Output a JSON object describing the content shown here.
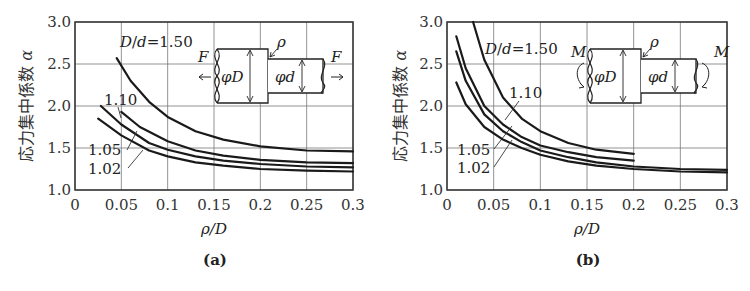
{
  "chart_data": [
    {
      "type": "line",
      "panel": "(a)",
      "title": "",
      "xlabel": "ρ/D",
      "ylabel": "応力集中係数 α",
      "xlim": [
        0,
        0.3
      ],
      "ylim": [
        1.0,
        3.0
      ],
      "xticks": [
        "0",
        "0.05",
        "0.1",
        "0.15",
        "0.2",
        "0.25",
        "0.3"
      ],
      "yticks": [
        "1.0",
        "1.5",
        "2.0",
        "2.5",
        "3.0"
      ],
      "grid": true,
      "load_symbol": "F",
      "inset_labels": {
        "big": "φD",
        "small": "φd",
        "radius": "ρ",
        "load_left": "F",
        "load_right": "F"
      },
      "series": [
        {
          "name": "D/d=1.50",
          "label": "D/d=1.50",
          "x": [
            0.045,
            0.06,
            0.08,
            0.1,
            0.13,
            0.16,
            0.2,
            0.25,
            0.3
          ],
          "y": [
            2.57,
            2.3,
            2.05,
            1.87,
            1.7,
            1.6,
            1.52,
            1.47,
            1.46
          ]
        },
        {
          "name": "1.10",
          "label": "1.10",
          "x": [
            0.05,
            0.07,
            0.1,
            0.13,
            0.16,
            0.2,
            0.25,
            0.3
          ],
          "y": [
            1.93,
            1.75,
            1.58,
            1.47,
            1.41,
            1.36,
            1.33,
            1.32
          ]
        },
        {
          "name": "1.05",
          "label": "1.05",
          "x": [
            0.028,
            0.05,
            0.08,
            0.1,
            0.13,
            0.16,
            0.2,
            0.25,
            0.3
          ],
          "y": [
            2.0,
            1.78,
            1.56,
            1.48,
            1.4,
            1.35,
            1.31,
            1.28,
            1.27
          ]
        },
        {
          "name": "1.02",
          "label": "1.02",
          "x": [
            0.025,
            0.05,
            0.08,
            0.1,
            0.13,
            0.16,
            0.2,
            0.25,
            0.3
          ],
          "y": [
            1.85,
            1.65,
            1.47,
            1.4,
            1.33,
            1.29,
            1.25,
            1.23,
            1.22
          ]
        }
      ]
    },
    {
      "type": "line",
      "panel": "(b)",
      "title": "",
      "xlabel": "ρ/D",
      "ylabel": "応力集中係数 α",
      "xlim": [
        0,
        0.3
      ],
      "ylim": [
        1.0,
        3.0
      ],
      "xticks": [
        "0",
        "0.05",
        "0.1",
        "0.15",
        "0.2",
        "0.25",
        "0.3"
      ],
      "yticks": [
        "1.0",
        "1.5",
        "2.0",
        "2.5",
        "3.0"
      ],
      "grid": true,
      "load_symbol": "M",
      "inset_labels": {
        "big": "φD",
        "small": "φd",
        "radius": "ρ",
        "load_left": "M",
        "load_right": "M"
      },
      "series": [
        {
          "name": "D/d=1.50",
          "label": "D/d=1.50",
          "x": [
            0.028,
            0.04,
            0.06,
            0.08,
            0.1,
            0.13,
            0.16,
            0.2
          ],
          "y": [
            3.0,
            2.55,
            2.1,
            1.85,
            1.7,
            1.56,
            1.48,
            1.43
          ]
        },
        {
          "name": "1.10",
          "label": "1.10",
          "x": [
            0.01,
            0.02,
            0.04,
            0.06,
            0.08,
            0.1,
            0.13,
            0.16,
            0.2
          ],
          "y": [
            2.83,
            2.45,
            2.0,
            1.78,
            1.63,
            1.53,
            1.45,
            1.39,
            1.35
          ]
        },
        {
          "name": "1.05",
          "label": "1.05",
          "x": [
            0.01,
            0.02,
            0.04,
            0.06,
            0.08,
            0.1,
            0.13,
            0.16,
            0.2,
            0.25,
            0.3
          ],
          "y": [
            2.65,
            2.3,
            1.9,
            1.7,
            1.57,
            1.47,
            1.39,
            1.33,
            1.28,
            1.25,
            1.24
          ]
        },
        {
          "name": "1.02",
          "label": "1.02",
          "x": [
            0.01,
            0.02,
            0.04,
            0.06,
            0.08,
            0.1,
            0.13,
            0.16,
            0.2,
            0.25,
            0.3
          ],
          "y": [
            2.28,
            2.02,
            1.75,
            1.6,
            1.5,
            1.42,
            1.34,
            1.29,
            1.25,
            1.22,
            1.21
          ]
        }
      ]
    }
  ],
  "captions": {
    "a": "(a)",
    "b": "(b)"
  },
  "axis": {
    "ylabel_text": "応力集中係数",
    "ylabel_symbol": "α",
    "xlabel": "ρ/D"
  }
}
